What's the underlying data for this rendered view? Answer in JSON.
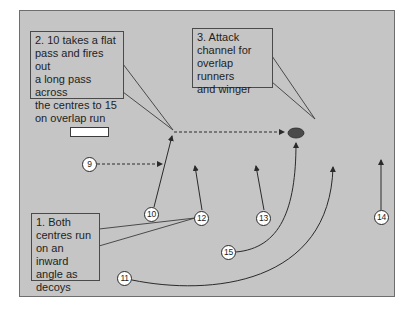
{
  "diagram": {
    "type": "rugby attacking move diagram",
    "colors": {
      "pitch": "#c5c5c5",
      "lines": "#2a2a2a",
      "ball": "#4a4a4a",
      "player_fill": "#ffffff"
    },
    "notes": [
      {
        "id": "note1",
        "text": "1. Both\ncentres run\non an inward\nangle as\ndecoys"
      },
      {
        "id": "note2",
        "text": "2. 10 takes a flat\npass and fires out\na long pass across\nthe centres to 15\non overlap run"
      },
      {
        "id": "note3",
        "text": "3. Attack\nchannel for\noverlap runners\nand winger"
      }
    ],
    "players": [
      {
        "number": "9",
        "x": 89,
        "y": 164
      },
      {
        "number": "10",
        "x": 151,
        "y": 214
      },
      {
        "number": "12",
        "x": 201,
        "y": 218
      },
      {
        "number": "13",
        "x": 263,
        "y": 218
      },
      {
        "number": "14",
        "x": 381,
        "y": 217
      },
      {
        "number": "15",
        "x": 228,
        "y": 252
      },
      {
        "number": "11",
        "x": 124,
        "y": 278
      }
    ],
    "passes": [
      {
        "from": "9",
        "to": "10",
        "style": "dashed"
      },
      {
        "from": "10",
        "to": "ball",
        "style": "dashed"
      }
    ],
    "ball": {
      "x": 296,
      "y": 133
    }
  }
}
